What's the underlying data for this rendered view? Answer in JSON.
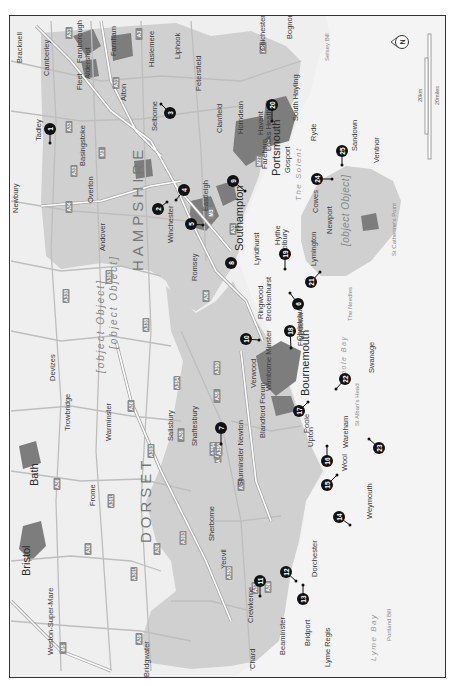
{
  "map": {
    "orientation": "north-right",
    "colors": {
      "sea": "#f4f4f4",
      "land_outside": "#f0f0f0",
      "study_area": "#cfcfcf",
      "urban": "#7a7a7a",
      "roads_minor": "#bdbdbd",
      "roads_major": "#ffffff",
      "marker": "#111111",
      "frame": "#333333"
    },
    "counties": [
      {
        "name": "HAMPSHIRE"
      },
      {
        "name": "DORSET"
      }
    ],
    "regions": [
      {
        "name": "Salisbury"
      },
      {
        "name": "Plain"
      },
      {
        "name": "Isle of Wight"
      }
    ],
    "water_labels": [
      {
        "name": "The Solent"
      },
      {
        "name": "Poole Bay"
      },
      {
        "name": "Lyme Bay"
      },
      {
        "name": "Selsey Bill"
      },
      {
        "name": "St Catherine's Point"
      },
      {
        "name": "The Needles"
      },
      {
        "name": "St Alban's Head"
      },
      {
        "name": "Portland Bill"
      }
    ],
    "cities": [
      {
        "name": "Southampton"
      },
      {
        "name": "Portsmouth"
      },
      {
        "name": "Bournemouth"
      },
      {
        "name": "Bristol"
      },
      {
        "name": "Bath"
      }
    ],
    "towns": [
      "Bracknell",
      "Camberley",
      "Fleet",
      "Farnborough",
      "Aldershot",
      "Farnham",
      "Haslemere",
      "Liphook",
      "Chichester",
      "Bognor Regis",
      "Petersfield",
      "Selborne",
      "Alton",
      "Tadley",
      "Basingstoke",
      "Overton",
      "Newbury",
      "Clanfield",
      "Horndean",
      "Havant",
      "South Hayling",
      "Locks Heath",
      "Fareham",
      "Gosport",
      "Eastleigh",
      "Winchester",
      "Andover",
      "Romsey",
      "Hythe",
      "Holbury",
      "Lyndhurst",
      "Ryde",
      "Sandown",
      "Ventnor",
      "Cowes",
      "Newport",
      "Lymington",
      "Brockenhurst",
      "Ringwood",
      "Christchurch",
      "Ferndown",
      "Verwood",
      "Wimborne Minster",
      "Salisbury",
      "Blandford Forum",
      "Poole",
      "Upton",
      "Swanage",
      "Wareham",
      "Wool",
      "Devizes",
      "Trowbridge",
      "Warminster",
      "Shaftesbury",
      "Sturminster Newton",
      "Frome",
      "Sherborne",
      "Yeovil",
      "Dorchester",
      "Weymouth",
      "Crewkerne",
      "Beaminster",
      "Bridport",
      "Chard",
      "Lyme Regis",
      "Weston-Super-Mare",
      "Bridgwater"
    ],
    "roads": [
      "A33",
      "A31",
      "A3",
      "M3",
      "A34",
      "A303",
      "A338",
      "A36",
      "A27",
      "M27",
      "A354",
      "A350",
      "A35",
      "A37",
      "A30",
      "A361",
      "A39",
      "M5"
    ],
    "markers": [
      {
        "num": "1"
      },
      {
        "num": "2"
      },
      {
        "num": "3"
      },
      {
        "num": "4"
      },
      {
        "num": "5"
      },
      {
        "num": "6"
      },
      {
        "num": "7"
      },
      {
        "num": "8"
      },
      {
        "num": "9"
      },
      {
        "num": "10"
      },
      {
        "num": "11"
      },
      {
        "num": "12"
      },
      {
        "num": "13"
      },
      {
        "num": "14"
      },
      {
        "num": "15"
      },
      {
        "num": "16"
      },
      {
        "num": "17"
      },
      {
        "num": "18"
      },
      {
        "num": "19"
      },
      {
        "num": "20"
      },
      {
        "num": "21"
      },
      {
        "num": "22"
      },
      {
        "num": "23"
      },
      {
        "num": "24"
      },
      {
        "num": "25"
      }
    ],
    "compass": {
      "label": "N"
    },
    "scale_bar": {
      "km_label": "20km",
      "miles_label": "20miles"
    }
  }
}
